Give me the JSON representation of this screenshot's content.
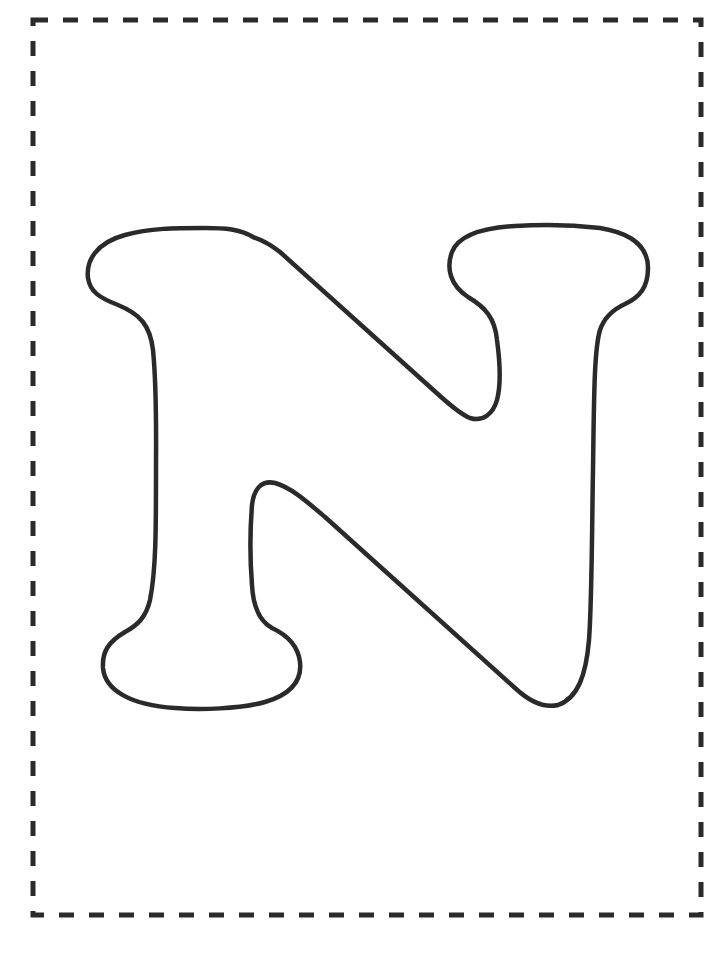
{
  "page": {
    "letter": "N",
    "background_color": "#ffffff",
    "stroke_color": "#2a2a2a",
    "border": {
      "style": "dashed",
      "color": "#2a2a2a"
    }
  }
}
